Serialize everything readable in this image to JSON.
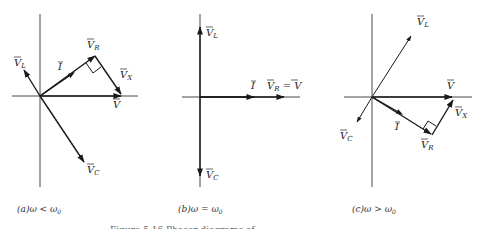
{
  "figure": {
    "caption_partial": "Figure 5.16 Phasor diagrams of ...",
    "panels": [
      {
        "id": "a",
        "caption": "(a)ω < ω0",
        "caption_parts": {
          "prefix": "(a)",
          "expr": "ω < ω",
          "sub": "0"
        },
        "labels": {
          "VL": {
            "main": "V",
            "sub": "L"
          },
          "I": {
            "main": "I",
            "sub": ""
          },
          "VR": {
            "main": "V",
            "sub": "R"
          },
          "VX": {
            "main": "V",
            "sub": "X"
          },
          "V": {
            "main": "V",
            "sub": ""
          },
          "VC": {
            "main": "V",
            "sub": "C"
          }
        }
      },
      {
        "id": "b",
        "caption": "(b)ω = ω0",
        "caption_parts": {
          "prefix": "(b)",
          "expr": "ω = ω",
          "sub": "0"
        },
        "labels": {
          "VL": {
            "main": "V",
            "sub": "L"
          },
          "I": {
            "main": "I",
            "sub": ""
          },
          "VR_eq_V": {
            "main": "V",
            "sub": "R",
            "eq": " = ",
            "rhs": "V"
          },
          "VC": {
            "main": "V",
            "sub": "C"
          }
        }
      },
      {
        "id": "c",
        "caption": "(c)ω > ω0",
        "caption_parts": {
          "prefix": "(c)",
          "expr": "ω > ω",
          "sub": "0"
        },
        "labels": {
          "VL": {
            "main": "V",
            "sub": "L"
          },
          "V": {
            "main": "V",
            "sub": ""
          },
          "VX": {
            "main": "V",
            "sub": "X"
          },
          "I": {
            "main": "I",
            "sub": ""
          },
          "VR": {
            "main": "V",
            "sub": "R"
          },
          "VC": {
            "main": "V",
            "sub": "C"
          }
        }
      }
    ]
  }
}
